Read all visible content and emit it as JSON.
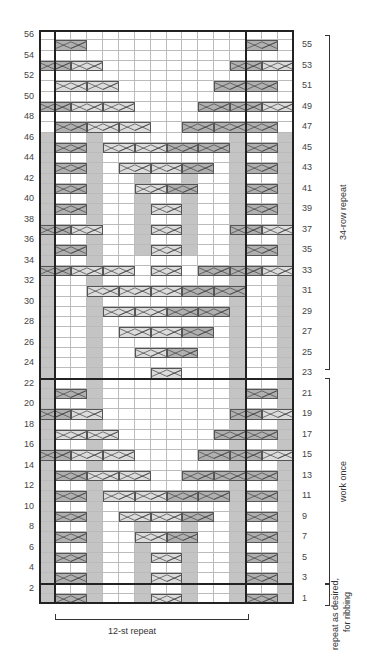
{
  "chart": {
    "cols": 16,
    "rows": 56,
    "repeat_cols": [
      1,
      12
    ],
    "colors": {
      "purl": "#c4c4c4",
      "cable_dark": "#b0b0b0",
      "cable_light": "#dcdcdc",
      "grid": "#bbbbbb",
      "outline": "#222222"
    },
    "purl_columns": [
      {
        "col": 0,
        "rows": [
          1,
          46
        ]
      },
      {
        "col": 3,
        "rows": [
          1,
          46
        ]
      },
      {
        "col": 15,
        "rows": [
          1,
          46
        ]
      },
      {
        "col": 12,
        "rows": [
          1,
          46
        ]
      },
      {
        "col": 6,
        "rows": [
          1,
          8
        ]
      },
      {
        "col": 9,
        "rows": [
          1,
          8
        ]
      },
      {
        "col": 6,
        "rows": [
          35,
          42
        ]
      },
      {
        "col": 9,
        "rows": [
          35,
          42
        ]
      }
    ],
    "cables": [
      {
        "row": 1,
        "col": 1,
        "w": 2,
        "shade": "dark"
      },
      {
        "row": 1,
        "col": 7,
        "w": 2,
        "shade": "light"
      },
      {
        "row": 1,
        "col": 13,
        "w": 2,
        "shade": "dark"
      },
      {
        "row": 3,
        "col": 1,
        "w": 2,
        "shade": "dark"
      },
      {
        "row": 3,
        "col": 7,
        "w": 2,
        "shade": "light"
      },
      {
        "row": 3,
        "col": 13,
        "w": 2,
        "shade": "dark"
      },
      {
        "row": 5,
        "col": 1,
        "w": 2,
        "shade": "dark"
      },
      {
        "row": 5,
        "col": 7,
        "w": 2,
        "shade": "light"
      },
      {
        "row": 5,
        "col": 13,
        "w": 2,
        "shade": "dark"
      },
      {
        "row": 7,
        "col": 1,
        "w": 2,
        "shade": "dark"
      },
      {
        "row": 7,
        "col": 6,
        "w": 2,
        "shade": "light"
      },
      {
        "row": 7,
        "col": 8,
        "w": 2,
        "shade": "dark"
      },
      {
        "row": 7,
        "col": 13,
        "w": 2,
        "shade": "dark"
      },
      {
        "row": 9,
        "col": 1,
        "w": 2,
        "shade": "dark"
      },
      {
        "row": 9,
        "col": 5,
        "w": 2,
        "shade": "light"
      },
      {
        "row": 9,
        "col": 7,
        "w": 2,
        "shade": "light"
      },
      {
        "row": 9,
        "col": 9,
        "w": 2,
        "shade": "dark"
      },
      {
        "row": 9,
        "col": 13,
        "w": 2,
        "shade": "dark"
      },
      {
        "row": 11,
        "col": 1,
        "w": 2,
        "shade": "dark"
      },
      {
        "row": 11,
        "col": 4,
        "w": 2,
        "shade": "light"
      },
      {
        "row": 11,
        "col": 6,
        "w": 2,
        "shade": "light"
      },
      {
        "row": 11,
        "col": 8,
        "w": 2,
        "shade": "dark"
      },
      {
        "row": 11,
        "col": 10,
        "w": 2,
        "shade": "dark"
      },
      {
        "row": 11,
        "col": 13,
        "w": 2,
        "shade": "dark"
      },
      {
        "row": 13,
        "col": 1,
        "w": 2,
        "shade": "dark"
      },
      {
        "row": 13,
        "col": 3,
        "w": 2,
        "shade": "light"
      },
      {
        "row": 13,
        "col": 5,
        "w": 2,
        "shade": "light"
      },
      {
        "row": 13,
        "col": 9,
        "w": 2,
        "shade": "dark"
      },
      {
        "row": 13,
        "col": 11,
        "w": 2,
        "shade": "dark"
      },
      {
        "row": 13,
        "col": 13,
        "w": 2,
        "shade": "dark"
      },
      {
        "row": 15,
        "col": 0,
        "w": 2,
        "shade": "dark"
      },
      {
        "row": 15,
        "col": 2,
        "w": 2,
        "shade": "light"
      },
      {
        "row": 15,
        "col": 4,
        "w": 2,
        "shade": "light"
      },
      {
        "row": 15,
        "col": 10,
        "w": 2,
        "shade": "dark"
      },
      {
        "row": 15,
        "col": 12,
        "w": 2,
        "shade": "dark"
      },
      {
        "row": 15,
        "col": 14,
        "w": 2,
        "shade": "light"
      },
      {
        "row": 17,
        "col": 1,
        "w": 2,
        "shade": "light"
      },
      {
        "row": 17,
        "col": 3,
        "w": 2,
        "shade": "light"
      },
      {
        "row": 17,
        "col": 11,
        "w": 2,
        "shade": "dark"
      },
      {
        "row": 17,
        "col": 13,
        "w": 2,
        "shade": "dark"
      },
      {
        "row": 19,
        "col": 0,
        "w": 2,
        "shade": "dark"
      },
      {
        "row": 19,
        "col": 2,
        "w": 2,
        "shade": "light"
      },
      {
        "row": 19,
        "col": 12,
        "w": 2,
        "shade": "dark"
      },
      {
        "row": 19,
        "col": 14,
        "w": 2,
        "shade": "light"
      },
      {
        "row": 21,
        "col": 1,
        "w": 2,
        "shade": "dark"
      },
      {
        "row": 21,
        "col": 13,
        "w": 2,
        "shade": "dark"
      },
      {
        "row": 23,
        "col": 7,
        "w": 2,
        "shade": "light"
      },
      {
        "row": 25,
        "col": 6,
        "w": 2,
        "shade": "light"
      },
      {
        "row": 25,
        "col": 8,
        "w": 2,
        "shade": "dark"
      },
      {
        "row": 27,
        "col": 5,
        "w": 2,
        "shade": "light"
      },
      {
        "row": 27,
        "col": 7,
        "w": 2,
        "shade": "light"
      },
      {
        "row": 27,
        "col": 9,
        "w": 2,
        "shade": "dark"
      },
      {
        "row": 29,
        "col": 4,
        "w": 2,
        "shade": "light"
      },
      {
        "row": 29,
        "col": 6,
        "w": 2,
        "shade": "light"
      },
      {
        "row": 29,
        "col": 8,
        "w": 2,
        "shade": "dark"
      },
      {
        "row": 29,
        "col": 10,
        "w": 2,
        "shade": "dark"
      },
      {
        "row": 31,
        "col": 3,
        "w": 2,
        "shade": "light"
      },
      {
        "row": 31,
        "col": 5,
        "w": 2,
        "shade": "light"
      },
      {
        "row": 31,
        "col": 7,
        "w": 2,
        "shade": "light"
      },
      {
        "row": 31,
        "col": 9,
        "w": 2,
        "shade": "dark"
      },
      {
        "row": 31,
        "col": 11,
        "w": 2,
        "shade": "dark"
      },
      {
        "row": 33,
        "col": 0,
        "w": 2,
        "shade": "dark"
      },
      {
        "row": 33,
        "col": 2,
        "w": 2,
        "shade": "light"
      },
      {
        "row": 33,
        "col": 4,
        "w": 2,
        "shade": "light"
      },
      {
        "row": 33,
        "col": 7,
        "w": 2,
        "shade": "light"
      },
      {
        "row": 33,
        "col": 10,
        "w": 2,
        "shade": "dark"
      },
      {
        "row": 33,
        "col": 12,
        "w": 2,
        "shade": "dark"
      },
      {
        "row": 33,
        "col": 14,
        "w": 2,
        "shade": "light"
      },
      {
        "row": 35,
        "col": 1,
        "w": 2,
        "shade": "dark"
      },
      {
        "row": 35,
        "col": 7,
        "w": 2,
        "shade": "light"
      },
      {
        "row": 35,
        "col": 13,
        "w": 2,
        "shade": "dark"
      },
      {
        "row": 37,
        "col": 0,
        "w": 2,
        "shade": "dark"
      },
      {
        "row": 37,
        "col": 2,
        "w": 2,
        "shade": "light"
      },
      {
        "row": 37,
        "col": 7,
        "w": 2,
        "shade": "light"
      },
      {
        "row": 37,
        "col": 12,
        "w": 2,
        "shade": "dark"
      },
      {
        "row": 37,
        "col": 14,
        "w": 2,
        "shade": "light"
      },
      {
        "row": 39,
        "col": 1,
        "w": 2,
        "shade": "dark"
      },
      {
        "row": 39,
        "col": 7,
        "w": 2,
        "shade": "light"
      },
      {
        "row": 39,
        "col": 13,
        "w": 2,
        "shade": "dark"
      },
      {
        "row": 41,
        "col": 1,
        "w": 2,
        "shade": "dark"
      },
      {
        "row": 41,
        "col": 6,
        "w": 2,
        "shade": "light"
      },
      {
        "row": 41,
        "col": 8,
        "w": 2,
        "shade": "dark"
      },
      {
        "row": 41,
        "col": 13,
        "w": 2,
        "shade": "dark"
      },
      {
        "row": 43,
        "col": 1,
        "w": 2,
        "shade": "dark"
      },
      {
        "row": 43,
        "col": 5,
        "w": 2,
        "shade": "light"
      },
      {
        "row": 43,
        "col": 7,
        "w": 2,
        "shade": "light"
      },
      {
        "row": 43,
        "col": 9,
        "w": 2,
        "shade": "dark"
      },
      {
        "row": 43,
        "col": 13,
        "w": 2,
        "shade": "dark"
      },
      {
        "row": 45,
        "col": 1,
        "w": 2,
        "shade": "dark"
      },
      {
        "row": 45,
        "col": 4,
        "w": 2,
        "shade": "light"
      },
      {
        "row": 45,
        "col": 6,
        "w": 2,
        "shade": "light"
      },
      {
        "row": 45,
        "col": 8,
        "w": 2,
        "shade": "dark"
      },
      {
        "row": 45,
        "col": 10,
        "w": 2,
        "shade": "dark"
      },
      {
        "row": 45,
        "col": 13,
        "w": 2,
        "shade": "dark"
      },
      {
        "row": 47,
        "col": 1,
        "w": 2,
        "shade": "dark"
      },
      {
        "row": 47,
        "col": 3,
        "w": 2,
        "shade": "light"
      },
      {
        "row": 47,
        "col": 5,
        "w": 2,
        "shade": "light"
      },
      {
        "row": 47,
        "col": 9,
        "w": 2,
        "shade": "dark"
      },
      {
        "row": 47,
        "col": 11,
        "w": 2,
        "shade": "dark"
      },
      {
        "row": 47,
        "col": 13,
        "w": 2,
        "shade": "dark"
      },
      {
        "row": 49,
        "col": 0,
        "w": 2,
        "shade": "dark"
      },
      {
        "row": 49,
        "col": 2,
        "w": 2,
        "shade": "light"
      },
      {
        "row": 49,
        "col": 4,
        "w": 2,
        "shade": "light"
      },
      {
        "row": 49,
        "col": 10,
        "w": 2,
        "shade": "dark"
      },
      {
        "row": 49,
        "col": 12,
        "w": 2,
        "shade": "dark"
      },
      {
        "row": 49,
        "col": 14,
        "w": 2,
        "shade": "light"
      },
      {
        "row": 51,
        "col": 1,
        "w": 2,
        "shade": "light"
      },
      {
        "row": 51,
        "col": 3,
        "w": 2,
        "shade": "light"
      },
      {
        "row": 51,
        "col": 11,
        "w": 2,
        "shade": "dark"
      },
      {
        "row": 51,
        "col": 13,
        "w": 2,
        "shade": "dark"
      },
      {
        "row": 53,
        "col": 0,
        "w": 2,
        "shade": "dark"
      },
      {
        "row": 53,
        "col": 2,
        "w": 2,
        "shade": "light"
      },
      {
        "row": 53,
        "col": 12,
        "w": 2,
        "shade": "dark"
      },
      {
        "row": 53,
        "col": 14,
        "w": 2,
        "shade": "light"
      },
      {
        "row": 55,
        "col": 1,
        "w": 2,
        "shade": "dark"
      },
      {
        "row": 55,
        "col": 13,
        "w": 2,
        "shade": "dark"
      }
    ],
    "section_dividers_after_row": [
      2,
      22
    ],
    "left_row_labels": [
      2,
      4,
      6,
      8,
      10,
      12,
      14,
      16,
      18,
      20,
      22,
      24,
      26,
      28,
      30,
      32,
      34,
      36,
      38,
      40,
      42,
      44,
      46,
      48,
      50,
      52,
      54,
      56
    ],
    "right_row_labels": [
      1,
      3,
      5,
      7,
      9,
      11,
      13,
      15,
      17,
      19,
      21,
      23,
      25,
      27,
      29,
      31,
      33,
      35,
      37,
      39,
      41,
      43,
      45,
      47,
      49,
      51,
      53,
      55
    ]
  },
  "annotations": {
    "repeat_34": "34-row repeat",
    "work_once": "work once",
    "ribbing_line1": "repeat as desired,",
    "ribbing_line2": "for ribbing",
    "stitch_repeat": "12-st repeat"
  }
}
